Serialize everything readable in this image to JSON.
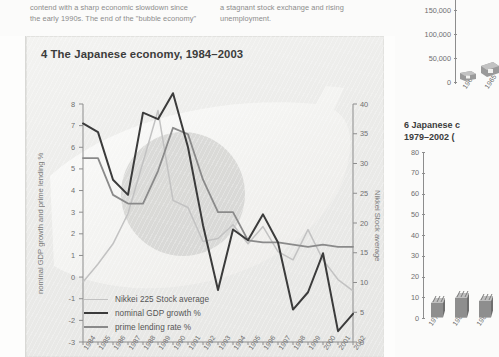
{
  "body_text": {
    "left_column": [
      "contend with a sharp economic slowdown since",
      "the early 1990s. The end of the \"bubble economy\""
    ],
    "right_column": [
      "a stagnant stock exchange and rising",
      "unemployment."
    ]
  },
  "main_chart": {
    "title": "4 The Japanese economy, 1984–2003",
    "axis_left_label": "nominal GDP growth and prime lending %",
    "axis_right_label": "Nikkei Stock average",
    "y_left_ticks": [
      "8",
      "7",
      "6",
      "5",
      "4",
      "3",
      "2",
      "1",
      "0",
      "-1",
      "-2",
      "-3"
    ],
    "y_right_ticks": [
      "40",
      "35",
      "30",
      "25",
      "20",
      "15",
      "10",
      "5",
      "0"
    ],
    "x_ticks": [
      "1984",
      "1985",
      "1986",
      "1987",
      "1988",
      "1989",
      "1990",
      "1991",
      "1992",
      "1993",
      "1994",
      "1995",
      "1996",
      "1997",
      "1998",
      "1999",
      "2000",
      "2001",
      "2002"
    ],
    "legend": [
      {
        "label": "Nikkei 225 Stock average",
        "color": "#c2c2c2",
        "width": 1.6
      },
      {
        "label": "nominal GDP growth %",
        "color": "#3b3b3b",
        "width": 2.4
      },
      {
        "label": "prime lending rate %",
        "color": "#8a8a8a",
        "width": 2.2
      }
    ]
  },
  "chart_data": {
    "type": "line",
    "title": "4 The Japanese economy, 1984–2003",
    "xlabel": "",
    "ylabel": "nominal GDP growth and prime lending %",
    "y2label": "Nikkei Stock average",
    "x": [
      1984,
      1985,
      1986,
      1987,
      1988,
      1989,
      1990,
      1991,
      1992,
      1993,
      1994,
      1995,
      1996,
      1997,
      1998,
      1999,
      2000,
      2001,
      2002
    ],
    "ylim": [
      -3,
      8
    ],
    "y2lim": [
      0,
      40
    ],
    "grid": false,
    "legend_position": "lower-left",
    "series": [
      {
        "name": "Nikkei 225 Stock average",
        "axis": "right",
        "color": "#c2c2c2",
        "units": "thousands",
        "values": [
          10.1,
          13.1,
          16.5,
          21.6,
          30.2,
          38.9,
          23.8,
          22.6,
          16.9,
          17.4,
          19.7,
          16.5,
          19.4,
          15.2,
          13.8,
          18.9,
          13.8,
          10.5,
          8.6
        ]
      },
      {
        "name": "nominal GDP growth %",
        "axis": "left",
        "color": "#3b3b3b",
        "units": "percent",
        "values": [
          7.1,
          6.7,
          4.5,
          3.8,
          7.6,
          7.3,
          8.5,
          6.0,
          2.4,
          -0.6,
          2.2,
          1.7,
          2.9,
          1.6,
          -1.5,
          -0.7,
          1.1,
          -2.5,
          -1.7
        ]
      },
      {
        "name": "prime lending rate %",
        "axis": "left",
        "color": "#8a8a8a",
        "units": "percent",
        "values": [
          5.5,
          5.5,
          3.8,
          3.4,
          3.4,
          4.9,
          6.9,
          6.6,
          4.5,
          3.0,
          3.0,
          1.7,
          1.6,
          1.6,
          1.5,
          1.4,
          1.5,
          1.4,
          1.4
        ]
      }
    ]
  },
  "right_top_chart": {
    "y_ticks": [
      "250,000",
      "200,000",
      "150,000",
      "100,000",
      "50,000",
      "0"
    ],
    "x_ticks": [
      "1960",
      "1965"
    ]
  },
  "right_bottom_chart": {
    "title_line1": "6 Japanese c",
    "title_line2": "1979–2002 (",
    "y_ticks": [
      "80",
      "70",
      "60",
      "50",
      "40",
      "30",
      "20",
      "10",
      "0"
    ],
    "x_ticks": [
      "1979",
      "1981",
      "1983"
    ],
    "bar_values": [
      7,
      9.5,
      8
    ]
  }
}
